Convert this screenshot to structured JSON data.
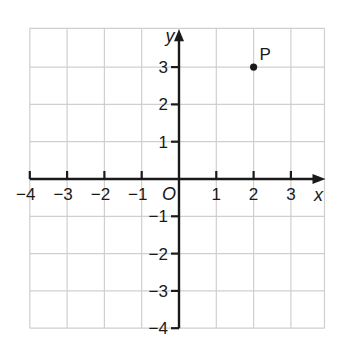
{
  "chart_data": {
    "type": "scatter",
    "title": "",
    "xlabel": "x",
    "ylabel": "y",
    "origin_label": "O",
    "xlim": [
      -4,
      3.8
    ],
    "ylim": [
      -4,
      3.8
    ],
    "grid": true,
    "x_ticks": [
      -4,
      -3,
      -2,
      -1,
      1,
      2,
      3
    ],
    "x_tick_labels": [
      "−4",
      "−3",
      "−2",
      "−1",
      "1",
      "2",
      "3"
    ],
    "y_ticks": [
      3,
      2,
      1,
      -1,
      -2,
      -3,
      -4
    ],
    "y_tick_labels": [
      "3",
      "2",
      "1",
      "−1",
      "−2",
      "−3",
      "−4"
    ],
    "points": [
      {
        "label": "P",
        "x": 2,
        "y": 3
      }
    ]
  },
  "colors": {
    "grid": "#cfcfcf",
    "axis": "#1a1a1a",
    "point": "#1a1a1a"
  }
}
